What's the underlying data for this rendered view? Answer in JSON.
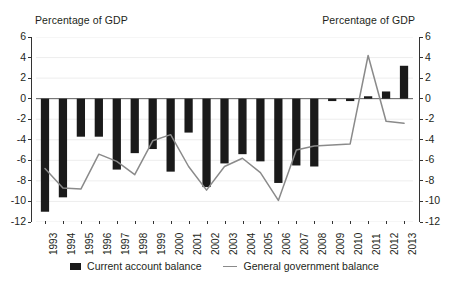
{
  "axis_caption_left": "Percentage of GDP",
  "axis_caption_right": "Percentage of GDP",
  "legend": {
    "bar_label": "Current account balance",
    "line_label": "General government balance"
  },
  "colors": {
    "bar": "#1a1a1a",
    "line": "#8a8a8a",
    "axis": "#333333",
    "grid": "#e8e8e8",
    "text": "#231f20"
  },
  "chart_data": {
    "type": "bar",
    "title": "",
    "subtitle": "",
    "xlabel": "",
    "ylabel": "Percentage of GDP",
    "ylabel_right": "Percentage of GDP",
    "ylim": [
      -12,
      6
    ],
    "yticks": [
      6,
      4,
      2,
      0,
      -2,
      -4,
      -6,
      -8,
      -10,
      -12
    ],
    "yticks_right": [
      6,
      4,
      2,
      0,
      -2,
      -4,
      -6,
      -8,
      -10,
      -12
    ],
    "grid": true,
    "legend_position": "bottom",
    "categories": [
      "1993",
      "1994",
      "1995",
      "1996",
      "1997",
      "1998",
      "1999",
      "2000",
      "2001",
      "2002",
      "2003",
      "2004",
      "2005",
      "2006",
      "2007",
      "2008",
      "2009",
      "2010",
      "2011",
      "2012",
      "2013"
    ],
    "series": [
      {
        "name": "Current account balance",
        "type": "bar",
        "color": "#1a1a1a",
        "values": [
          -11.0,
          -9.6,
          -3.7,
          -3.7,
          -6.9,
          -5.3,
          -4.9,
          -7.1,
          -3.3,
          -8.6,
          -6.3,
          -5.4,
          -6.1,
          -8.2,
          -6.5,
          -6.6,
          -0.2,
          -0.2,
          0.2,
          0.7,
          3.2
        ]
      },
      {
        "name": "General government balance",
        "type": "line",
        "color": "#8a8a8a",
        "values": [
          -6.8,
          -8.7,
          -8.8,
          -5.4,
          -6.1,
          -7.4,
          -4.1,
          -3.5,
          -6.6,
          -8.9,
          -6.6,
          -5.8,
          -7.2,
          -9.9,
          -5.0,
          -4.6,
          -4.5,
          -4.4,
          4.2,
          -2.2,
          -2.4
        ]
      }
    ]
  }
}
